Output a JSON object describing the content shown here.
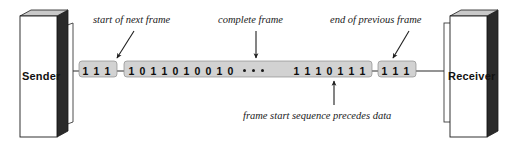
{
  "diagram": {
    "nodes": {
      "sender": {
        "label": "Sender"
      },
      "receiver": {
        "label": "Receiver"
      }
    },
    "callouts": {
      "start_of_next_frame": "start of next frame",
      "complete_frame": "complete frame",
      "end_of_previous_frame": "end of previous frame",
      "frame_start_note": "frame start sequence precedes data"
    },
    "bitstream": {
      "end_of_previous_frame_bits": [
        "1",
        "1",
        "1"
      ],
      "complete_frame_left_bits": [
        "1",
        "0",
        "1",
        "1",
        "0",
        "1",
        "0",
        "0",
        "1",
        "0"
      ],
      "ellipsis": "• • •",
      "complete_frame_right_bits": [
        "1",
        "1",
        "1",
        "0",
        "1",
        "1",
        "1"
      ],
      "start_of_next_frame_bits": [
        "1",
        "1",
        "1"
      ]
    },
    "colors": {
      "band_fill": "#d2d2d2",
      "band_stroke": "#7a7a7a",
      "box_face": "#ffffff",
      "box_side_dark": "#2a2a2a",
      "box_top": "#c9c9c9",
      "line": "#2b2b2b",
      "text": "#111111"
    }
  }
}
